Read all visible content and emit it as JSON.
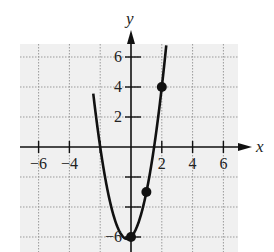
{
  "chart_data": {
    "type": "line",
    "title": "",
    "xlabel": "x",
    "ylabel": "y",
    "xlim": [
      -7,
      7
    ],
    "ylim": [
      -7,
      7
    ],
    "grid": true,
    "x_ticks": [
      -6,
      -4,
      2,
      4,
      6
    ],
    "x_tick_labels": [
      "−6",
      "−4",
      "2",
      "4",
      "6"
    ],
    "y_ticks": [
      6,
      4,
      2,
      -2,
      -4,
      -6
    ],
    "y_tick_labels": [
      "6",
      "4",
      "2",
      "",
      "",
      "−6"
    ],
    "series": [
      {
        "name": "y = 2x² + x − 6",
        "kind": "parabola",
        "coefficients": {
          "a": 2,
          "b": 1,
          "c": -6
        },
        "points": [
          [
            0,
            -6
          ],
          [
            1,
            -3
          ],
          [
            2,
            4
          ]
        ]
      }
    ],
    "colors": {
      "curve": "#111111",
      "grid": "#9a9a9a",
      "background": "#f0f0f0"
    }
  },
  "labels": {
    "x_axis": "x",
    "y_axis": "y"
  }
}
